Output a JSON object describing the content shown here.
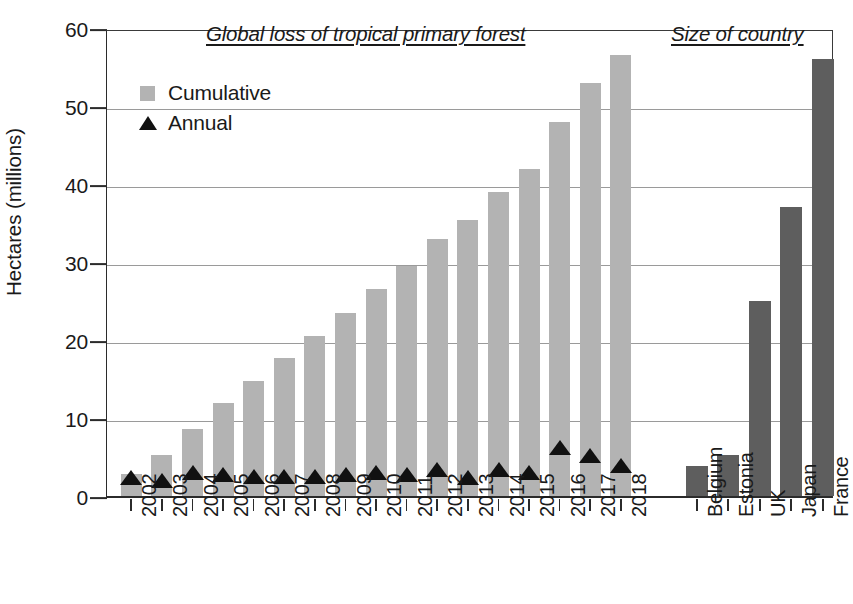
{
  "chart_data": {
    "type": "bar",
    "title": "",
    "xlabel": "",
    "ylabel": "Hectares (millions)",
    "ylim": [
      0,
      60
    ],
    "yticks": [
      0,
      10,
      20,
      30,
      40,
      50,
      60
    ],
    "grid": true,
    "legend_position": "upper-left",
    "panels": [
      {
        "name": "forest-loss",
        "title": "Global loss of tropical primary forest",
        "categories": [
          "2002",
          "2003",
          "2004",
          "2005",
          "2006",
          "2007",
          "2008",
          "2009",
          "2010",
          "2011",
          "2012",
          "2013",
          "2014",
          "2015",
          "2016",
          "2017",
          "2018"
        ],
        "series": [
          {
            "name": "Cumulative",
            "marker": "bar",
            "color": "#b3b3b3",
            "values": [
              2.8,
              5.2,
              8.6,
              11.9,
              14.8,
              17.7,
              20.5,
              23.4,
              26.6,
              29.5,
              33.0,
              35.4,
              39.0,
              41.9,
              47.9,
              53.0,
              56.6
            ]
          },
          {
            "name": "Annual",
            "marker": "triangle",
            "color": "#111111",
            "values": [
              2.8,
              2.4,
              3.4,
              3.2,
              2.9,
              3.0,
              3.0,
              3.2,
              3.4,
              3.2,
              3.8,
              2.8,
              3.9,
              3.4,
              6.7,
              5.6,
              4.3
            ]
          }
        ]
      },
      {
        "name": "country-size",
        "title": "Size of country",
        "categories": [
          "Belgium",
          "Estonia",
          "UK",
          "Japan",
          "France"
        ],
        "series": [
          {
            "name": "Size of country",
            "marker": "bar",
            "color": "#5e5e5e",
            "values": [
              3.9,
              5.3,
              25.0,
              37.0,
              56.0
            ]
          }
        ]
      }
    ]
  },
  "legend": {
    "items": [
      {
        "label": "Cumulative",
        "marker": "square-swatch-icon"
      },
      {
        "label": "Annual",
        "marker": "triangle-swatch-icon"
      }
    ]
  }
}
